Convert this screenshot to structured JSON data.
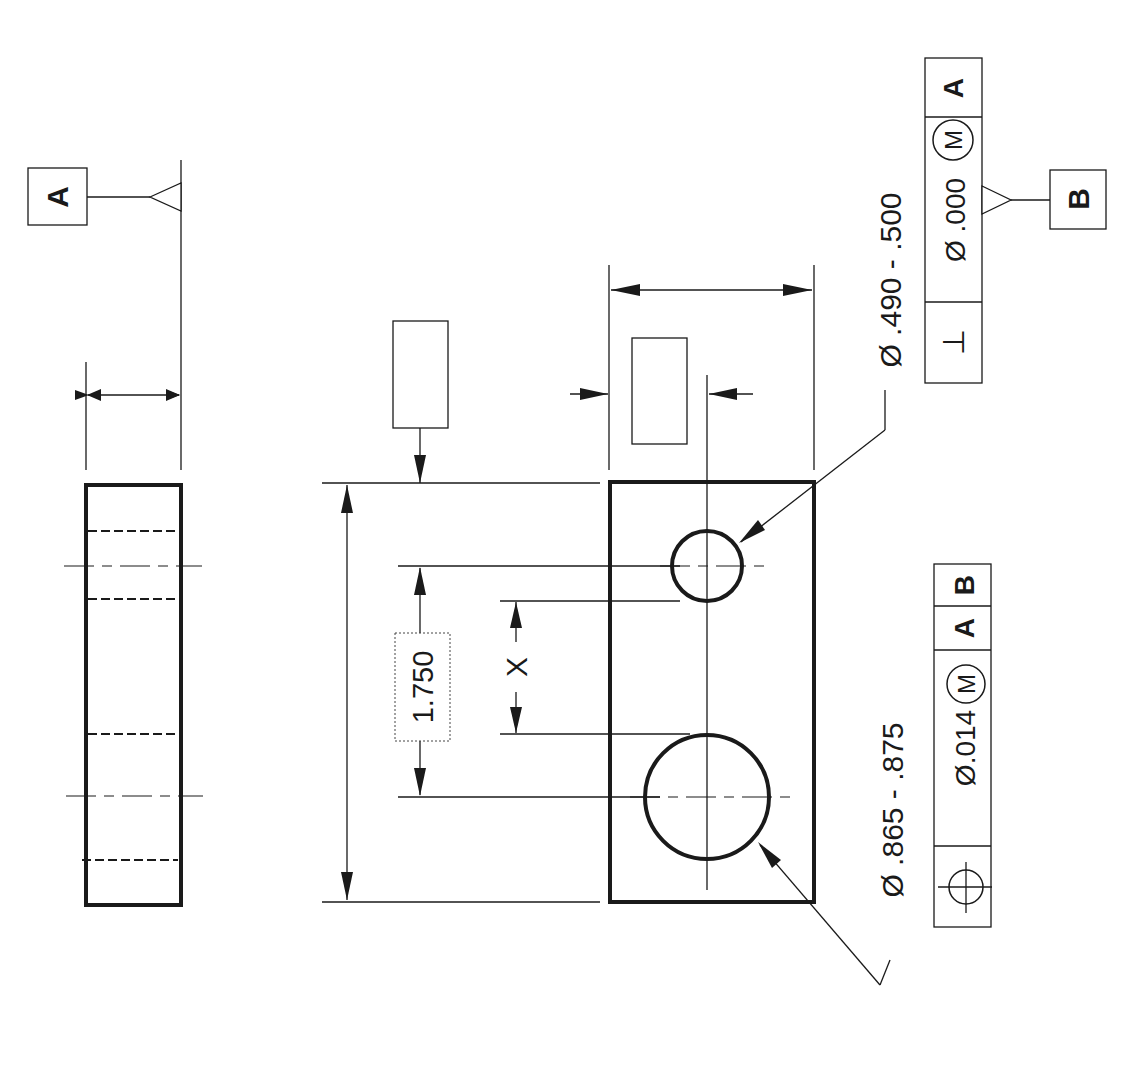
{
  "drawing": {
    "type": "GD&T engineering drawing (rotated 90°)",
    "datum_a": {
      "label": "A"
    },
    "datum_b": {
      "label": "B"
    },
    "basic_dimension": "1.750",
    "unknown_dimension": "X",
    "small_hole": {
      "size": "Ø .490 - .500",
      "fcf": {
        "symbol": "⊥",
        "symbol_name": "perpendicularity",
        "tolerance": "Ø .000",
        "modifier": "M",
        "datums": [
          "A"
        ]
      }
    },
    "large_hole": {
      "size": "Ø .865 - .875",
      "fcf": {
        "symbol": "⌖",
        "symbol_name": "position",
        "tolerance": "Ø.014",
        "modifier": "M",
        "datums": [
          "A",
          "B"
        ]
      }
    },
    "blank_boxes": 2
  }
}
